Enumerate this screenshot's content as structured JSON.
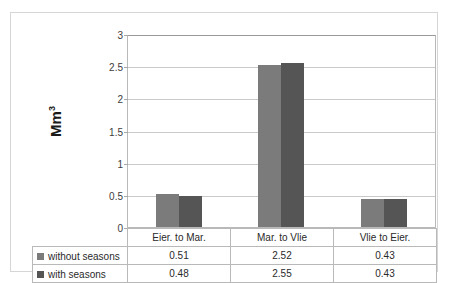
{
  "chart_data": {
    "type": "bar",
    "title": "",
    "xlabel": "",
    "ylabel": "Mm",
    "ylabel_superscript": "3",
    "ylim": [
      0,
      3
    ],
    "ytick_labels": [
      "3",
      "2.5",
      "2",
      "1.5",
      "1",
      "0.5",
      "0"
    ],
    "ytick_values": [
      3,
      2.5,
      2,
      1.5,
      1,
      0.5,
      0
    ],
    "grid": true,
    "legend_position": "table-left",
    "categories": [
      "Eier. to Mar.",
      "Mar. to Vlie",
      "Vlie to Eier."
    ],
    "series": [
      {
        "name": "without seasons",
        "color": "#7b7b7b",
        "values": [
          0.51,
          2.52,
          0.43
        ],
        "value_labels": [
          "0.51",
          "2.52",
          "0.43"
        ]
      },
      {
        "name": "with seasons",
        "color": "#555555",
        "values": [
          0.48,
          2.55,
          0.43
        ],
        "value_labels": [
          "0.48",
          "2.55",
          "0.43"
        ]
      }
    ]
  },
  "table": {
    "legend_header": "",
    "rows": [
      {
        "label": "without seasons",
        "cells": [
          "0.51",
          "2.52",
          "0.43"
        ]
      },
      {
        "label": "with seasons",
        "cells": [
          "0.48",
          "2.55",
          "0.43"
        ]
      }
    ]
  },
  "colors": {
    "series_without_seasons": "#7b7b7b",
    "series_with_seasons": "#555555",
    "gridline": "#c9c9c9",
    "plot_border": "#b9b9b9",
    "outer_border": "#d6d6d6",
    "text": "#2a2a2a"
  }
}
